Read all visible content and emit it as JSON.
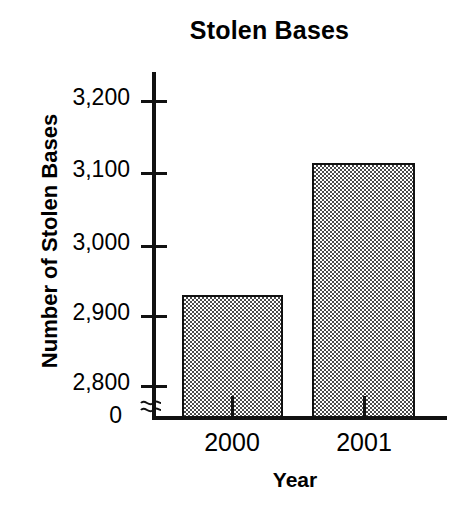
{
  "chart_data": {
    "type": "bar",
    "title": "Stolen Bases",
    "xlabel": "Year",
    "ylabel": "Number of Stolen Bases",
    "categories": [
      "2000",
      "2001"
    ],
    "values": [
      2928,
      3112
    ],
    "ytick_labels": [
      "3,200",
      "3,100",
      "3,000",
      "2,900",
      "2,800",
      "0"
    ],
    "ytick_values": [
      3200,
      3100,
      3000,
      2900,
      2800,
      0
    ],
    "ylim": [
      2800,
      3240
    ],
    "axis_break": true,
    "axis_break_symbol": "≈",
    "grid": false,
    "legend": false,
    "bar_fill": "#a8a8a8",
    "bar_border": "#111111",
    "axis_color": "#111111",
    "background": "#ffffff"
  },
  "ticks": {
    "y": [
      {
        "label": "3,200",
        "top": 100
      },
      {
        "label": "3,100",
        "top": 172
      },
      {
        "label": "3,000",
        "top": 245
      },
      {
        "label": "2,900",
        "top": 315
      },
      {
        "label": "2,800",
        "top": 385
      }
    ],
    "zero_label": "0",
    "x": [
      {
        "label": "2000",
        "center": 232
      },
      {
        "label": "2001",
        "center": 364
      }
    ]
  },
  "bars": [
    {
      "name": "bar-2000",
      "label": "2000",
      "value": 2928,
      "left": 182,
      "width": 101,
      "top": 295
    },
    {
      "name": "bar-2001",
      "label": "2001",
      "value": 3112,
      "left": 312,
      "width": 103,
      "top": 163
    }
  ]
}
